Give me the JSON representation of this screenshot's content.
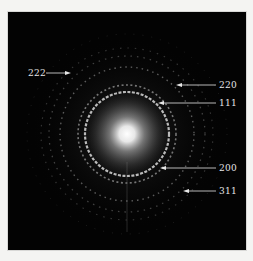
{
  "figure": {
    "type": "selected-area electron diffraction pattern",
    "background_color": "#030303",
    "frame_color": "#f4f4f2",
    "center_glow_color": "#ffffff",
    "ring_color": "#d8d8d8",
    "label_color": "#e6e6e6"
  },
  "annotations": [
    {
      "id": "222",
      "label": "222",
      "arrow_direction": "right"
    },
    {
      "id": "220",
      "label": "220",
      "arrow_direction": "left"
    },
    {
      "id": "111",
      "label": "111",
      "arrow_direction": "left"
    },
    {
      "id": "200",
      "label": "200",
      "arrow_direction": "left"
    },
    {
      "id": "311",
      "label": "311",
      "arrow_direction": "left"
    }
  ]
}
